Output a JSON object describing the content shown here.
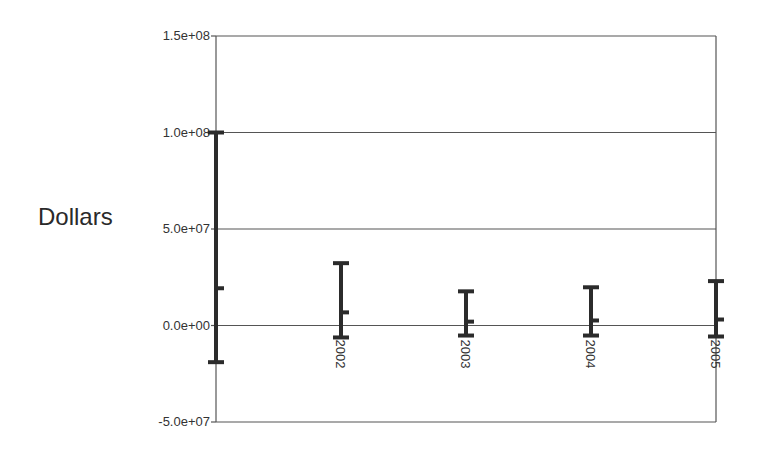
{
  "chart_data": {
    "type": "errorbar",
    "title": "",
    "xlabel": "",
    "ylabel": "Dollars",
    "ylim": [
      -50000000,
      150000000
    ],
    "yticks": [
      {
        "value": 150000000,
        "label": "1.5e+08"
      },
      {
        "value": 100000000,
        "label": "1.0e+08"
      },
      {
        "value": 50000000,
        "label": "5.0e+07"
      },
      {
        "value": 0,
        "label": "0.0e+00"
      },
      {
        "value": -50000000,
        "label": "-5.0e+07"
      }
    ],
    "gridlines": [
      100000000,
      50000000,
      0
    ],
    "categories": [
      "",
      "2002",
      "2003",
      "2004",
      "2005"
    ],
    "series": [
      {
        "name": "Dollars",
        "points": [
          {
            "x": "",
            "high": 100000000,
            "mid": 19300000,
            "low": -19000000
          },
          {
            "x": "2002",
            "high": 32300000,
            "mid": 6800000,
            "low": -6200000
          },
          {
            "x": "2003",
            "high": 17700000,
            "mid": 2000000,
            "low": -5200000
          },
          {
            "x": "2004",
            "high": 19800000,
            "mid": 2600000,
            "low": -5200000
          },
          {
            "x": "2005",
            "high": 23000000,
            "mid": 3100000,
            "low": -5700000
          }
        ]
      }
    ],
    "legend": "none",
    "grid": true,
    "colors": {
      "bar": "#2b2b2b",
      "grid": "#555555",
      "axis": "#555555"
    }
  }
}
